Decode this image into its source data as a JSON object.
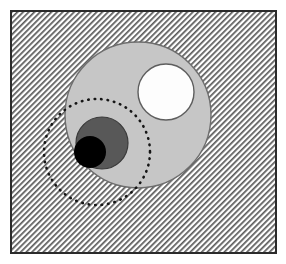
{
  "figure": {
    "title": "Nested circles set diagram on hatched square",
    "canvas": {
      "width": 286,
      "height": 264,
      "background": "#ffffff"
    },
    "frame": {
      "label": "hatched-square-region",
      "x": 11,
      "y": 11,
      "width": 265,
      "height": 242,
      "fill_pattern": "diagonal-hatch-45",
      "fill_base_color": "#ffffff",
      "hatch_line_color": "#5a5a5a",
      "hatch_spacing": 4,
      "hatch_line_width": 1.7,
      "hatch_angle_deg": 45,
      "stroke_color": "#2b2b2b",
      "stroke_width": 2
    },
    "shapes": [
      {
        "name": "large-light-gray-circle",
        "kind": "circle",
        "cx": 138,
        "cy": 115,
        "r": 73,
        "fill": "#c6c6c6",
        "stroke": "#6e6e6e",
        "stroke_width": 1.4,
        "stroke_style": "solid"
      },
      {
        "name": "dashed-outline-circle",
        "kind": "circle",
        "cx": 97,
        "cy": 152,
        "r": 53,
        "fill": "none",
        "stroke": "#151515",
        "stroke_width": 2.6,
        "stroke_style": "dotted",
        "dash_pattern": "0.5 6"
      },
      {
        "name": "white-circle",
        "kind": "circle",
        "cx": 166,
        "cy": 92,
        "r": 28,
        "fill": "#fdfdfd",
        "stroke": "#5e5e5e",
        "stroke_width": 1.4,
        "stroke_style": "solid"
      },
      {
        "name": "dark-gray-circle",
        "kind": "circle",
        "cx": 102,
        "cy": 143,
        "r": 26,
        "fill": "#585858",
        "stroke": "#3a3a3a",
        "stroke_width": 1.2,
        "stroke_style": "solid"
      },
      {
        "name": "black-circle",
        "kind": "circle",
        "cx": 90,
        "cy": 152,
        "r": 16,
        "fill": "#000000",
        "stroke": "none",
        "stroke_width": 0,
        "stroke_style": "none"
      }
    ]
  }
}
